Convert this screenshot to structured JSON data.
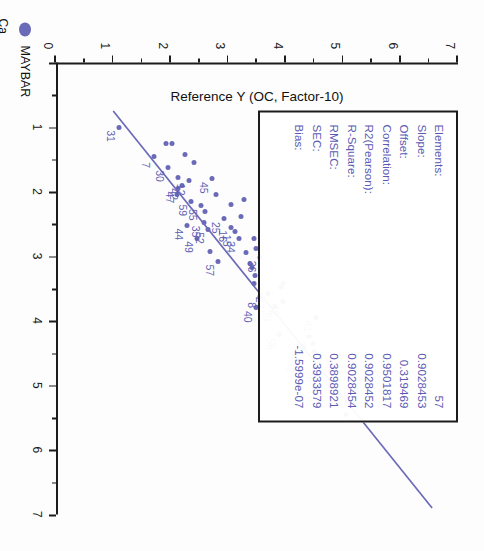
{
  "chart": {
    "title": "dicted vs. Reference (PCR) De trend",
    "y_axis_title": "Reference Y (OC, Factor-10)",
    "legend": {
      "label": "MAYBAR",
      "sub_label": "Ca",
      "marker_color": "#6a6ab8"
    },
    "line_color": "#6a6ab8",
    "text_color": "#5a5ab4"
  },
  "stats": {
    "title": "Regression statistics",
    "rows": [
      {
        "key": "Elements:",
        "value": "57"
      },
      {
        "key": "Slope:",
        "value": "0.9028453"
      },
      {
        "key": "Offset:",
        "value": "0.319469"
      },
      {
        "key": "Correlation:",
        "value": "0.9501817"
      },
      {
        "key": "R2(Pearson):",
        "value": "0.9028452"
      },
      {
        "key": "R-Square:",
        "value": "0.9028454"
      },
      {
        "key": "RMSEC:",
        "value": "0.3898921"
      },
      {
        "key": "SEC:",
        "value": "0.3933579"
      },
      {
        "key": "Bias:",
        "value": "-1.5999e-07"
      }
    ]
  },
  "chart_data": {
    "type": "scatter",
    "title": "dicted vs. Reference (PCR) De trend",
    "xlabel": "Predicted Y (PCR)",
    "ylabel": "Reference Y (OC, Factor-10)",
    "xlim": [
      0,
      7
    ],
    "ylim": [
      0,
      7
    ],
    "xticks": [
      1,
      2,
      3,
      4,
      5,
      6,
      7
    ],
    "yticks": [
      0,
      1,
      2,
      3,
      4,
      5,
      6,
      7
    ],
    "grid": false,
    "legend_position": "bottom-left",
    "n_points": 57,
    "fit_line": {
      "slope": 0.9028453,
      "intercept": 0.319469,
      "x_start": 0.75,
      "x_end": 6.9
    },
    "series": [
      {
        "name": "MAYBAR",
        "marker_color": "#6a6ab8",
        "points": [
          {
            "label": "31",
            "x": 1.0,
            "y": 1.1
          },
          {
            "label": "7",
            "x": 1.45,
            "y": 1.7
          },
          {
            "label": "30",
            "x": 1.62,
            "y": 1.95
          },
          {
            "label": "",
            "x": 1.25,
            "y": 1.92
          },
          {
            "label": "",
            "x": 1.25,
            "y": 2.02
          },
          {
            "label": "",
            "x": 1.42,
            "y": 2.25
          },
          {
            "label": "47",
            "x": 1.95,
            "y": 2.12
          },
          {
            "label": "42",
            "x": 1.9,
            "y": 2.2
          },
          {
            "label": "12",
            "x": 1.83,
            "y": 2.32
          },
          {
            "label": "",
            "x": 1.78,
            "y": 2.12
          },
          {
            "label": "59",
            "x": 2.15,
            "y": 2.35
          },
          {
            "label": "55",
            "x": 2.22,
            "y": 2.52
          },
          {
            "label": "45",
            "x": 1.8,
            "y": 2.72
          },
          {
            "label": "44",
            "x": 2.52,
            "y": 2.28
          },
          {
            "label": "49",
            "x": 2.72,
            "y": 2.45
          },
          {
            "label": "35",
            "x": 2.48,
            "y": 2.58
          },
          {
            "label": "52",
            "x": 2.58,
            "y": 2.65
          },
          {
            "label": "",
            "x": 2.3,
            "y": 2.6
          },
          {
            "label": "25",
            "x": 2.42,
            "y": 2.92
          },
          {
            "label": "16",
            "x": 2.55,
            "y": 3.05
          },
          {
            "label": "15",
            "x": 2.62,
            "y": 3.12
          },
          {
            "label": "34",
            "x": 2.72,
            "y": 3.18
          },
          {
            "label": "",
            "x": 2.2,
            "y": 3.05
          },
          {
            "label": "",
            "x": 2.38,
            "y": 3.22
          },
          {
            "label": "57",
            "x": 3.08,
            "y": 2.82
          },
          {
            "label": "36",
            "x": 3.02,
            "y": 3.55
          },
          {
            "label": "",
            "x": 2.72,
            "y": 3.45
          },
          {
            "label": "",
            "x": 2.88,
            "y": 3.48
          },
          {
            "label": "",
            "x": 3.18,
            "y": 3.42
          },
          {
            "label": "",
            "x": 3.3,
            "y": 3.46
          },
          {
            "label": "",
            "x": 3.42,
            "y": 3.44
          },
          {
            "label": "8",
            "x": 3.62,
            "y": 3.56
          },
          {
            "label": "40",
            "x": 3.8,
            "y": 3.48
          },
          {
            "label": "27",
            "x": 3.58,
            "y": 3.7
          },
          {
            "label": "39",
            "x": 3.78,
            "y": 3.82
          },
          {
            "label": "42b",
            "x": 3.7,
            "y": 3.95
          },
          {
            "label": "",
            "x": 3.48,
            "y": 3.92
          },
          {
            "label": "",
            "x": 3.42,
            "y": 3.95
          },
          {
            "label": "56",
            "x": 4.22,
            "y": 3.88
          },
          {
            "label": "41",
            "x": 3.95,
            "y": 4.52
          },
          {
            "label": "38",
            "x": 4.25,
            "y": 4.4
          },
          {
            "label": "32",
            "x": 4.42,
            "y": 4.32
          },
          {
            "label": "2",
            "x": 4.62,
            "y": 4.22
          },
          {
            "label": "26",
            "x": 4.72,
            "y": 4.55
          },
          {
            "label": "10",
            "x": 5.02,
            "y": 4.58
          },
          {
            "label": "6",
            "x": 5.15,
            "y": 4.92
          },
          {
            "label": "58",
            "x": 5.05,
            "y": 5.22
          },
          {
            "label": "",
            "x": 4.35,
            "y": 4.48
          },
          {
            "label": "",
            "x": 4.48,
            "y": 4.5
          },
          {
            "label": "",
            "x": 5.45,
            "y": 5.05
          },
          {
            "label": "",
            "x": 2.05,
            "y": 2.78
          },
          {
            "label": "",
            "x": 2.95,
            "y": 3.3
          },
          {
            "label": "",
            "x": 3.12,
            "y": 3.38
          },
          {
            "label": "",
            "x": 2.12,
            "y": 3.28
          },
          {
            "label": "",
            "x": 1.55,
            "y": 2.4
          },
          {
            "label": "",
            "x": 2.92,
            "y": 2.68
          },
          {
            "label": "",
            "x": 2.05,
            "y": 2.1
          }
        ]
      }
    ]
  }
}
